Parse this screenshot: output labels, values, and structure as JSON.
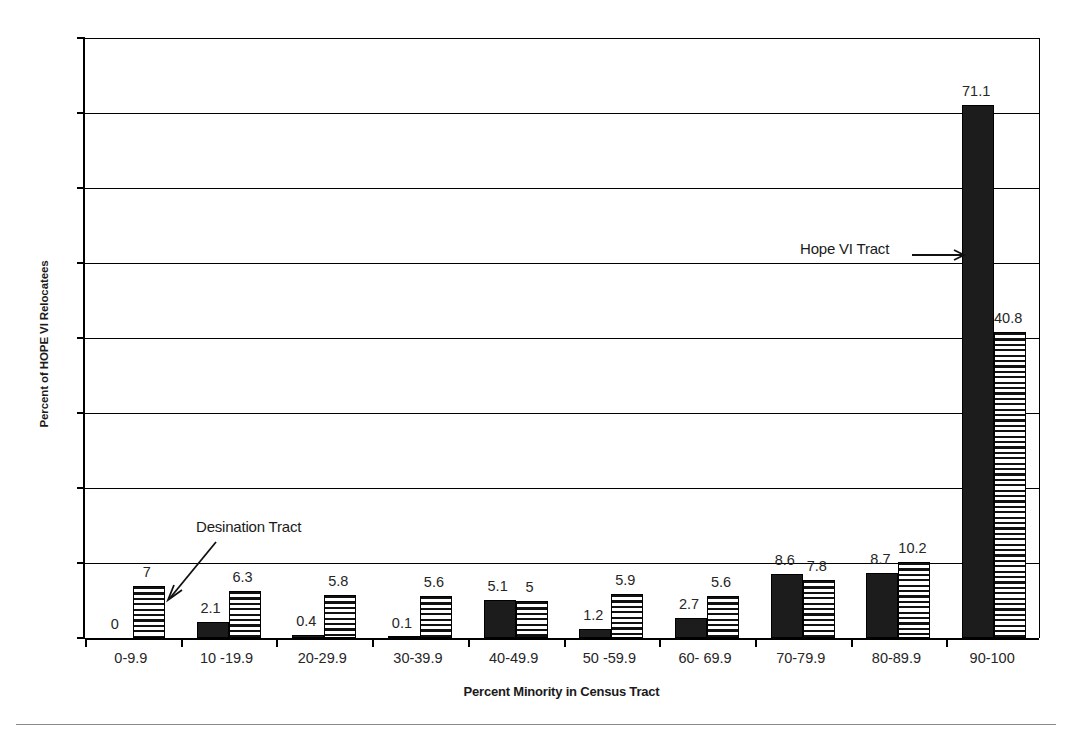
{
  "chart_data": {
    "type": "bar",
    "title": "",
    "xlabel": "Percent Minority in Census Tract",
    "ylabel": "Percent of HOPE VI Relocatees",
    "categories": [
      "0-9.9",
      "10 -19.9",
      "20-29.9",
      "30-39.9",
      "40-49.9",
      "50 -59.9",
      "60- 69.9",
      "70-79.9",
      "80-89.9",
      "90-100"
    ],
    "series": [
      {
        "name": "Hope VI Tract",
        "pattern": "solid-black",
        "values": [
          0,
          2.1,
          0.4,
          0.1,
          5.1,
          1.2,
          2.7,
          8.6,
          8.7,
          71.1
        ],
        "labels": [
          "0",
          "2.1",
          "0.4",
          "0.1",
          "5.1",
          "1.2",
          "2.7",
          "8.6",
          "8.7",
          "71.1"
        ]
      },
      {
        "name": "Desination Tract",
        "pattern": "horizontal-stripes",
        "values": [
          7,
          6.3,
          5.8,
          5.6,
          5,
          5.9,
          5.6,
          7.8,
          10.2,
          40.8
        ],
        "labels": [
          "7",
          "6.3",
          "5.8",
          "5.6",
          "5",
          "5.9",
          "5.6",
          "7.8",
          "10.2",
          "40.8"
        ]
      }
    ],
    "ylim": [
      0,
      80
    ],
    "yticks": [
      "0",
      "10",
      "20",
      "30",
      "40",
      "50",
      "60",
      "70",
      "80"
    ],
    "grid": "horizontal",
    "legend_position": "none",
    "annotations": [
      {
        "text": "Hope VI Tract",
        "arrow": "right",
        "target_series": "Hope VI Tract",
        "target_category": "90-100"
      },
      {
        "text": "Desination Tract",
        "arrow": "down-left",
        "target_series": "Desination Tract",
        "target_category": "0-9.9"
      }
    ],
    "colors": {
      "bar_solid": "#1c1c1c",
      "bar_stripe": "#111111",
      "axis": "#000000",
      "text": "#262626"
    }
  }
}
